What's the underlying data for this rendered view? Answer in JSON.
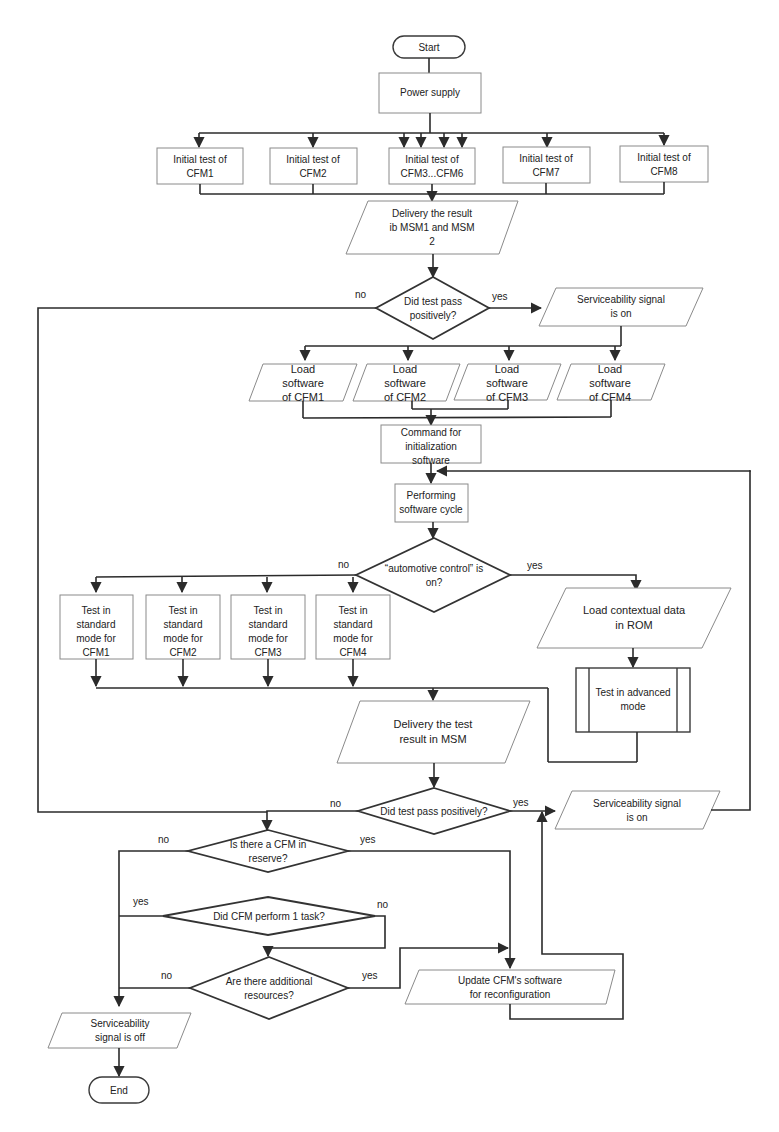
{
  "nodes": {
    "start": "Start",
    "power_supply": "Power supply",
    "initial_tests": [
      {
        "line1": "Initial test of",
        "line2": "CFM1"
      },
      {
        "line1": "Initial test of",
        "line2": "CFM2"
      },
      {
        "line1": "Initial test of",
        "line2": "CFM3...CFM6"
      },
      {
        "line1": "Initial test of",
        "line2": "CFM7"
      },
      {
        "line1": "Initial test of",
        "line2": "CFM8"
      }
    ],
    "delivery_result": {
      "line1": "Delivery the result",
      "line2": "ib MSM1 and MSM",
      "line3": "2"
    },
    "decision_test_pass_1": {
      "line1": "Did test pass",
      "line2": "positively?"
    },
    "serviceability_on_1": {
      "line1": "Serviceability signal",
      "line2": "is on"
    },
    "load_software": [
      {
        "line1": "Load",
        "line2": "software",
        "line3": "of CFM1"
      },
      {
        "line1": "Load",
        "line2": "software",
        "line3": "of CFM2"
      },
      {
        "line1": "Load",
        "line2": "software",
        "line3": "of CFM3"
      },
      {
        "line1": "Load",
        "line2": "software",
        "line3": "of CFM4"
      }
    ],
    "command_init": {
      "line1": "Command for",
      "line2": "initialization",
      "line3": "software"
    },
    "performing_cycle": {
      "line1": "Performing",
      "line2": "software cycle"
    },
    "decision_auto_control": {
      "line1": "“automotive control” is",
      "line2": "on?"
    },
    "standard_tests": [
      {
        "line1": "Test in",
        "line2": "standard",
        "line3": "mode for",
        "line4": "CFM1"
      },
      {
        "line1": "Test in",
        "line2": "standard",
        "line3": "mode for",
        "line4": "CFM2"
      },
      {
        "line1": "Test in",
        "line2": "standard",
        "line3": "mode for",
        "line4": "CFM3"
      },
      {
        "line1": "Test in",
        "line2": "standard",
        "line3": "mode for",
        "line4": "CFM4"
      }
    ],
    "load_contextual": {
      "line1": "Load contextual data",
      "line2": "in ROM"
    },
    "advanced_test": {
      "line1": "Test in advanced",
      "line2": "mode"
    },
    "delivery_test_result": {
      "line1": "Delivery the test",
      "line2": "result in MSM"
    },
    "decision_test_pass_2": "Did test pass positively?",
    "serviceability_on_2": {
      "line1": "Serviceability signal",
      "line2": "is on"
    },
    "decision_cfm_reserve": {
      "line1": "Is there a CFM in",
      "line2": "reserve?"
    },
    "decision_cfm_task": "Did CFM perform 1 task?",
    "decision_additional": {
      "line1": "Are there additional",
      "line2": "resources?"
    },
    "update_software": {
      "line1": "Update CFM's software",
      "line2": "for reconfiguration"
    },
    "serviceability_off": {
      "line1": "Serviceability",
      "line2": "signal is off"
    },
    "end": "End"
  },
  "labels": {
    "yes": "yes",
    "no": "no"
  }
}
